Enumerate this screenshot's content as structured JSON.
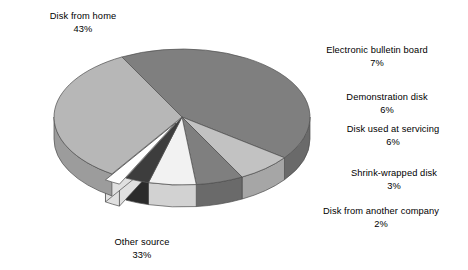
{
  "chart_data": {
    "type": "pie",
    "title": "",
    "subtitle": "",
    "xlabel": "",
    "ylabel": "",
    "legend_position": "none",
    "grid": false,
    "style": "3d-exploded-grayscale",
    "units": "%",
    "categories": [
      "Disk from home",
      "Electronic bulletin board",
      "Demonstration disk",
      "Disk used at servicing",
      "Shrink-wrapped disk",
      "Disk from another company",
      "Other source"
    ],
    "values": [
      43,
      7,
      6,
      6,
      3,
      2,
      33
    ],
    "slices": [
      {
        "label": "Disk from home",
        "value": 43,
        "value_text": "43%",
        "color": "#7f7f7f",
        "side_color": "#6a6a6a",
        "exploded": false
      },
      {
        "label": "Electronic bulletin board",
        "value": 7,
        "value_text": "7%",
        "color": "#c2c2c2",
        "side_color": "#a6a6a6",
        "exploded": false
      },
      {
        "label": "Demonstration disk",
        "value": 6,
        "value_text": "6%",
        "color": "#7f7f7f",
        "side_color": "#6a6a6a",
        "exploded": false
      },
      {
        "label": "Disk used at servicing",
        "value": 6,
        "value_text": "6%",
        "color": "#f2f2f2",
        "side_color": "#d2d2d2",
        "exploded": false
      },
      {
        "label": "Shrink-wrapped disk",
        "value": 3,
        "value_text": "3%",
        "color": "#3d3d3d",
        "side_color": "#2b2b2b",
        "exploded": false
      },
      {
        "label": "Disk from another company",
        "value": 2,
        "value_text": "2%",
        "color": "#ffffff",
        "side_color": "#e0e0e0",
        "exploded": true
      },
      {
        "label": "Other source",
        "value": 33,
        "value_text": "33%",
        "color": "#b7b7b7",
        "side_color": "#9c9c9c",
        "exploded": false
      }
    ]
  },
  "labels": {
    "disk_from_home": {
      "name": "Disk from home",
      "value": "43%"
    },
    "electronic_bulletin": {
      "name": "Electronic bulletin board",
      "value": "7%"
    },
    "demonstration_disk": {
      "name": "Demonstration disk",
      "value": "6%"
    },
    "disk_used_servicing": {
      "name": "Disk used at servicing",
      "value": "6%"
    },
    "shrink_wrapped": {
      "name": "Shrink-wrapped disk",
      "value": "3%"
    },
    "disk_another_co": {
      "name": "Disk from another company",
      "value": "2%"
    },
    "other_source": {
      "name": "Other source",
      "value": "33%"
    }
  },
  "colors": {
    "background": "#ffffff",
    "text": "#000000",
    "outline": "#4d4d4d"
  }
}
